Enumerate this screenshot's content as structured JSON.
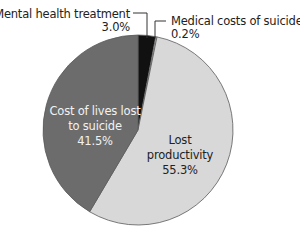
{
  "chart_data": {
    "type": "pie",
    "title": "",
    "start_angle_deg": 0,
    "direction": "clockwise",
    "center": [
      138,
      130
    ],
    "radius": 95,
    "outline_color": "#5a5a5a",
    "slices": [
      {
        "name": "Mental health treatment",
        "value": 3.0,
        "value_label": "3.0%",
        "color": "#111111",
        "label_position": "outside",
        "label_lines": [
          "Mental health treatment",
          "3.0%"
        ],
        "label_align": "end",
        "label_x": 130,
        "label_y": [
          18,
          31
        ],
        "leader": [
          [
            133,
            13
          ],
          [
            147,
            13
          ],
          [
            147,
            38
          ]
        ],
        "text_color": "#222222"
      },
      {
        "name": "Medical costs of suicide",
        "value": 0.2,
        "value_label": "0.2%",
        "color": "#ffffff",
        "label_position": "outside",
        "label_lines": [
          "Medical costs of suicide",
          "0.2%"
        ],
        "label_align": "start",
        "label_x": 171,
        "label_y": [
          25,
          38
        ],
        "leader": [
          [
            166,
            21
          ],
          [
            155,
            21
          ],
          [
            155,
            38
          ]
        ],
        "text_color": "#222222"
      },
      {
        "name": "Lost productivity",
        "value": 55.3,
        "value_label": "55.3%",
        "color": "#d8d8d8",
        "label_position": "inside",
        "label_lines": [
          "Lost",
          "productivity",
          "55.3%"
        ],
        "label_align": "middle",
        "label_x": 180,
        "label_y": [
          144,
          159,
          174
        ],
        "text_color": "#222222"
      },
      {
        "name": "Cost of lives lost to suicide",
        "value": 41.5,
        "value_label": "41.5%",
        "color": "#6c6c6c",
        "label_position": "inside",
        "label_lines": [
          "Cost of lives lost",
          "to suicide",
          "41.5%"
        ],
        "label_align": "middle",
        "label_x": 95,
        "label_y": [
          115,
          130,
          145
        ],
        "text_color": "#f2f2f2"
      }
    ],
    "legend": null
  }
}
